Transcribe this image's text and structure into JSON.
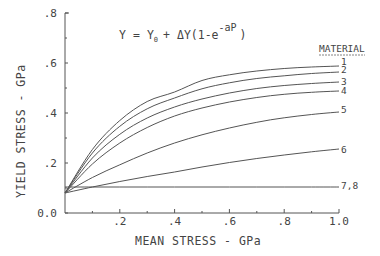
{
  "chart_data": {
    "type": "line",
    "title": "",
    "equation": {
      "lhs": "Y",
      "eq": "=",
      "y0": "Y",
      "y0_sub": "0",
      "plus": "+",
      "delta": "ΔY(1-e",
      "exp": "-aP",
      "close": ")"
    },
    "xlabel": "MEAN STRESS - GPa",
    "ylabel": "YIELD STRESS - GPa",
    "xlim": [
      0,
      1.0
    ],
    "ylim": [
      0,
      0.8
    ],
    "x_ticks": [
      ".2",
      ".4",
      ".6",
      ".8",
      "1.0"
    ],
    "y_ticks": [
      "0.0",
      ".2",
      ".4",
      ".6",
      ".8"
    ],
    "grid": false,
    "legend_title": "MATERIAL",
    "x": [
      0,
      0.1,
      0.2,
      0.3,
      0.4,
      0.5,
      0.6,
      0.7,
      0.8,
      0.9,
      1.0
    ],
    "series": [
      {
        "name": "1",
        "values": [
          0.08,
          0.254,
          0.37,
          0.446,
          0.484,
          0.53,
          0.553,
          0.568,
          0.578,
          0.584,
          0.588
        ]
      },
      {
        "name": "2",
        "values": [
          0.08,
          0.24,
          0.347,
          0.417,
          0.46,
          0.497,
          0.521,
          0.538,
          0.549,
          0.558,
          0.564
        ]
      },
      {
        "name": "3",
        "values": [
          0.08,
          0.22,
          0.315,
          0.38,
          0.424,
          0.456,
          0.48,
          0.498,
          0.51,
          0.518,
          0.524
        ]
      },
      {
        "name": "4",
        "values": [
          0.08,
          0.196,
          0.28,
          0.342,
          0.388,
          0.42,
          0.444,
          0.462,
          0.475,
          0.483,
          0.488
        ]
      },
      {
        "name": "5",
        "values": [
          0.08,
          0.142,
          0.193,
          0.24,
          0.28,
          0.313,
          0.34,
          0.363,
          0.381,
          0.394,
          0.404
        ]
      },
      {
        "name": "6",
        "values": [
          0.08,
          0.104,
          0.126,
          0.146,
          0.164,
          0.184,
          0.202,
          0.218,
          0.232,
          0.245,
          0.256
        ]
      },
      {
        "name": "7,8",
        "values": [
          0.104,
          0.104,
          0.104,
          0.104,
          0.104,
          0.104,
          0.104,
          0.104,
          0.104,
          0.104,
          0.104
        ]
      }
    ],
    "colors": {
      "line": "#555555",
      "axis": "#555555",
      "text": "#444444",
      "background": "#ffffff"
    }
  }
}
